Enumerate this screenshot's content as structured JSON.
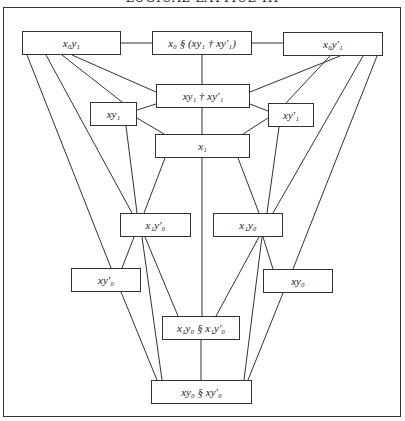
{
  "title": "LOGICAL LATTICE III",
  "colors": {
    "line": "#333333",
    "background": "#ffffff",
    "text": "#222222"
  },
  "nodes": [
    {
      "id": "x0y1",
      "label": "x₀y₁",
      "x": 22,
      "y": 31,
      "w": 99,
      "h": 24
    },
    {
      "id": "x0_sect",
      "label": "x₀ § (xy₁ † xy′₁)",
      "x": 152,
      "y": 31,
      "w": 100,
      "h": 24
    },
    {
      "id": "x0yp1",
      "label": "x₀y′₁",
      "x": 283,
      "y": 32,
      "w": 100,
      "h": 24
    },
    {
      "id": "xy1_dag",
      "label": "xy₁ † xy′₁",
      "x": 156,
      "y": 84,
      "w": 94,
      "h": 24
    },
    {
      "id": "xy1",
      "label": "xy₁",
      "x": 90,
      "y": 102,
      "w": 47,
      "h": 24
    },
    {
      "id": "xyp1",
      "label": "xy′₁",
      "x": 268,
      "y": 103,
      "w": 46,
      "h": 24
    },
    {
      "id": "x1",
      "label": "x₁",
      "x": 155,
      "y": 134,
      "w": 95,
      "h": 24
    },
    {
      "id": "x1yp0",
      "label": "x₁y′₀",
      "x": 120,
      "y": 213,
      "w": 71,
      "h": 24
    },
    {
      "id": "x1y0",
      "label": "x₁y₀",
      "x": 213,
      "y": 213,
      "w": 70,
      "h": 24
    },
    {
      "id": "xyp0",
      "label": "xy′₀",
      "x": 71,
      "y": 268,
      "w": 70,
      "h": 24
    },
    {
      "id": "xy0",
      "label": "xy₀",
      "x": 263,
      "y": 269,
      "w": 70,
      "h": 24
    },
    {
      "id": "x1y0_sect",
      "label": "x₁y₀ § x₁y′₀",
      "x": 162,
      "y": 316,
      "w": 78,
      "h": 24
    },
    {
      "id": "xy0_sect",
      "label": "xy₀ § xy′₀",
      "x": 151,
      "y": 380,
      "w": 101,
      "h": 24
    }
  ],
  "edges": [
    [
      121,
      43,
      152,
      43
    ],
    [
      252,
      43,
      283,
      43
    ],
    [
      202,
      55,
      202,
      84
    ],
    [
      202,
      108,
      202,
      134
    ],
    [
      202,
      158,
      202,
      316
    ],
    [
      201,
      340,
      201,
      380
    ],
    [
      27,
      55,
      111,
      268
    ],
    [
      46,
      55,
      132,
      213
    ],
    [
      62,
      55,
      122,
      102
    ],
    [
      72,
      55,
      156,
      92
    ],
    [
      340,
      56,
      250,
      92
    ],
    [
      330,
      56,
      286,
      103
    ],
    [
      363,
      56,
      273,
      213
    ],
    [
      377,
      56,
      293,
      269
    ],
    [
      137,
      110,
      156,
      104
    ],
    [
      137,
      118,
      164,
      134
    ],
    [
      126,
      126,
      137,
      213
    ],
    [
      268,
      111,
      250,
      104
    ],
    [
      268,
      118,
      243,
      134
    ],
    [
      279,
      127,
      267,
      213
    ],
    [
      165,
      158,
      144,
      213
    ],
    [
      238,
      158,
      259,
      213
    ],
    [
      134,
      237,
      122,
      268
    ],
    [
      142,
      237,
      162,
      380
    ],
    [
      145,
      237,
      178,
      316
    ],
    [
      263,
      237,
      273,
      269
    ],
    [
      262,
      237,
      244,
      380
    ],
    [
      259,
      237,
      216,
      316
    ],
    [
      121,
      292,
      157,
      380
    ],
    [
      283,
      293,
      248,
      380
    ]
  ]
}
